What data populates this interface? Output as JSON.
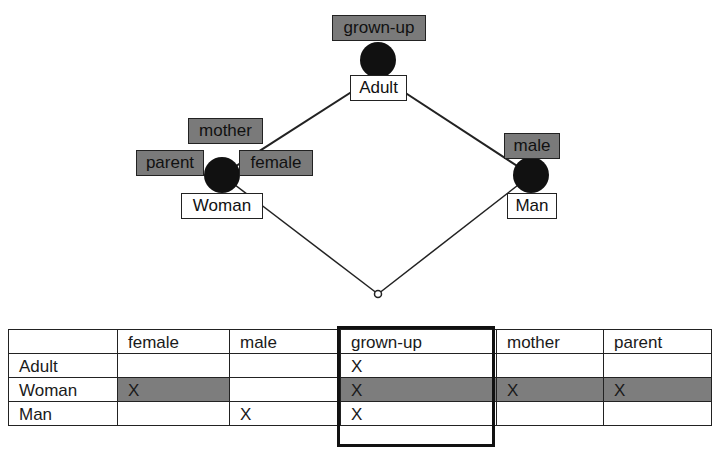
{
  "lattice": {
    "nodes": [
      {
        "id": "top",
        "object_label": "Adult",
        "attribute_labels": [
          "grown-up"
        ]
      },
      {
        "id": "left",
        "object_label": "Woman",
        "attribute_labels": [
          "mother",
          "parent",
          "female"
        ]
      },
      {
        "id": "right",
        "object_label": "Man",
        "attribute_labels": [
          "male"
        ]
      },
      {
        "id": "bottom",
        "object_label": "",
        "attribute_labels": []
      }
    ],
    "edges": [
      [
        "top",
        "left"
      ],
      [
        "top",
        "right"
      ],
      [
        "left",
        "bottom"
      ],
      [
        "right",
        "bottom"
      ]
    ]
  },
  "table": {
    "headers": [
      "",
      "female",
      "male",
      "grown-up",
      "mother",
      "parent"
    ],
    "rows": [
      {
        "object": "Adult",
        "cells": [
          "",
          "",
          "X",
          "",
          ""
        ],
        "highlighted": false
      },
      {
        "object": "Woman",
        "cells": [
          "X",
          "",
          "X",
          "X",
          "X"
        ],
        "highlighted": true
      },
      {
        "object": "Man",
        "cells": [
          "",
          "X",
          "X",
          "",
          ""
        ],
        "highlighted": false
      }
    ],
    "highlighted_column": "grown-up"
  },
  "colors": {
    "attribute_fill": "#7a7a7a",
    "highlight_row": "#7d7d7d",
    "node": "#111111"
  }
}
